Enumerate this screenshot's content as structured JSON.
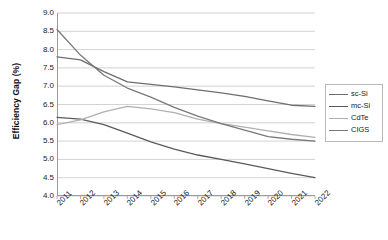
{
  "chart_data": {
    "type": "line",
    "title": "",
    "xlabel": "",
    "ylabel": "Efficiency Gap (%)",
    "categories": [
      "2011",
      "2012",
      "2013",
      "2014",
      "2015",
      "2016",
      "2017",
      "2018",
      "2019",
      "2020",
      "2021",
      "2022"
    ],
    "x": [
      2011,
      2012,
      2013,
      2014,
      2015,
      2016,
      2017,
      2018,
      2019,
      2020,
      2021,
      2022
    ],
    "ylim": [
      4.0,
      9.0
    ],
    "ytick_labels": [
      "9.0",
      "8.5",
      "8.0",
      "7.5",
      "7.0",
      "6.5",
      "6.0",
      "5.5",
      "5.0",
      "4.5",
      "4.0"
    ],
    "ytick_values": [
      9.0,
      8.5,
      8.0,
      7.5,
      7.0,
      6.5,
      6.0,
      5.5,
      5.0,
      4.5,
      4.0
    ],
    "grid": true,
    "legend_position": "right",
    "series": [
      {
        "name": "sc-Si",
        "color": "#6e6e6e",
        "values": [
          7.8,
          7.72,
          7.4,
          7.12,
          7.05,
          6.98,
          6.9,
          6.82,
          6.72,
          6.6,
          6.48,
          6.45
        ]
      },
      {
        "name": "mc-Si",
        "color": "#5a5a5a",
        "values": [
          6.15,
          6.1,
          5.95,
          5.72,
          5.48,
          5.28,
          5.12,
          5.0,
          4.88,
          4.75,
          4.62,
          4.5
        ]
      },
      {
        "name": "CdTe",
        "color": "#b0b0b0",
        "values": [
          5.95,
          6.08,
          6.3,
          6.45,
          6.38,
          6.28,
          6.1,
          5.98,
          5.88,
          5.78,
          5.68,
          5.6
        ]
      },
      {
        "name": "CIGS",
        "color": "#787878",
        "values": [
          8.55,
          7.85,
          7.3,
          6.95,
          6.7,
          6.42,
          6.18,
          5.98,
          5.8,
          5.62,
          5.55,
          5.5
        ]
      }
    ]
  },
  "legend": {
    "items": [
      {
        "label": "sc-Si"
      },
      {
        "label": "mc-Si"
      },
      {
        "label": "CdTe"
      },
      {
        "label": "CIGS"
      }
    ]
  }
}
